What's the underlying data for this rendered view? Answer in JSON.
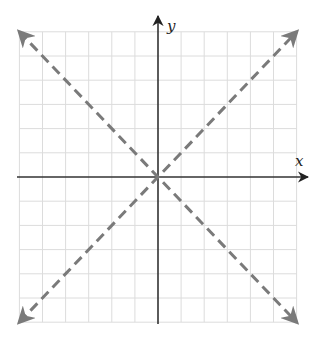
{
  "chart_data": {
    "type": "line",
    "title": "",
    "xlabel": "x",
    "ylabel": "y",
    "xlim": [
      -6,
      6
    ],
    "ylim": [
      -6,
      6
    ],
    "grid": true,
    "tick_labels": false,
    "series": [
      {
        "name": "y = x",
        "style": "dashed",
        "arrows": "both",
        "x": [
          -6,
          6
        ],
        "y": [
          -6,
          6
        ]
      },
      {
        "name": "y = -x",
        "style": "dashed",
        "arrows": "both",
        "x": [
          -6,
          6
        ],
        "y": [
          6,
          -6
        ]
      }
    ]
  },
  "colors": {
    "grid": "#dcdcdc",
    "axis": "#333333",
    "line": "#7a7a7a"
  },
  "labels": {
    "x_axis": "x",
    "y_axis": "y"
  }
}
